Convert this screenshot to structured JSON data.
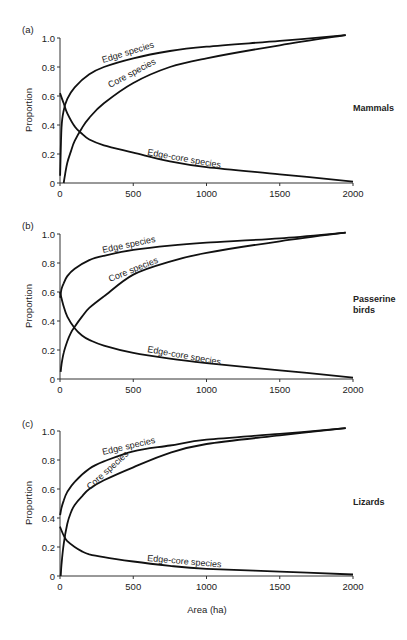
{
  "figure": {
    "xlabel": "Area (ha)",
    "ylabel": "Proportion"
  },
  "chart_data": [
    {
      "type": "line",
      "panel": "(a)",
      "title": "Mammals",
      "xlabel": "",
      "ylabel": "Proportion",
      "xlim": [
        0,
        2000
      ],
      "ylim": [
        0,
        1.0
      ],
      "xticks": [
        0,
        500,
        1000,
        1500,
        2000
      ],
      "yticks": [
        0,
        0.2,
        0.4,
        0.6,
        0.8,
        1.0
      ],
      "ytick_labels": [
        "0",
        "0.2",
        "0.4",
        "0.6",
        "0.8",
        "1.0"
      ],
      "grid": false,
      "series": [
        {
          "name": "Edge species",
          "x": [
            1,
            10,
            25,
            50,
            100,
            200,
            300,
            500,
            750,
            1000,
            1500,
            1950
          ],
          "values": [
            0.05,
            0.38,
            0.5,
            0.58,
            0.66,
            0.75,
            0.8,
            0.86,
            0.91,
            0.94,
            0.98,
            1.02
          ]
        },
        {
          "name": "Core species",
          "x": [
            25,
            35,
            50,
            75,
            100,
            150,
            200,
            300,
            500,
            750,
            1000,
            1500,
            1950
          ],
          "values": [
            0.0,
            0.06,
            0.14,
            0.22,
            0.29,
            0.38,
            0.45,
            0.55,
            0.69,
            0.8,
            0.86,
            0.95,
            1.02
          ]
        },
        {
          "name": "Edge-core species",
          "x": [
            0,
            25,
            50,
            100,
            150,
            200,
            300,
            500,
            750,
            1000,
            1500,
            2000
          ],
          "values": [
            0.62,
            0.55,
            0.48,
            0.39,
            0.34,
            0.3,
            0.26,
            0.21,
            0.15,
            0.11,
            0.06,
            0.01
          ]
        }
      ]
    },
    {
      "type": "line",
      "panel": "(b)",
      "title": "Passerine birds",
      "xlabel": "",
      "ylabel": "Proportion",
      "xlim": [
        0,
        2000
      ],
      "ylim": [
        0,
        1.0
      ],
      "xticks": [
        0,
        500,
        1000,
        1500,
        2000
      ],
      "yticks": [
        0,
        0.2,
        0.4,
        0.6,
        0.8,
        1.0
      ],
      "ytick_labels": [
        "0",
        "0.2",
        "0.4",
        "0.6",
        "0.8",
        "1.0"
      ],
      "grid": false,
      "series": [
        {
          "name": "Edge species",
          "x": [
            1,
            10,
            25,
            50,
            100,
            200,
            300,
            500,
            750,
            1000,
            1500,
            1950
          ],
          "values": [
            0.56,
            0.62,
            0.66,
            0.71,
            0.76,
            0.82,
            0.85,
            0.89,
            0.92,
            0.94,
            0.97,
            1.01
          ]
        },
        {
          "name": "Core species",
          "x": [
            5,
            10,
            25,
            50,
            75,
            100,
            150,
            200,
            300,
            500,
            750,
            1000,
            1500,
            1950
          ],
          "values": [
            0.05,
            0.1,
            0.18,
            0.26,
            0.32,
            0.36,
            0.43,
            0.49,
            0.57,
            0.72,
            0.81,
            0.87,
            0.95,
            1.01
          ]
        },
        {
          "name": "Edge-core species",
          "x": [
            0,
            25,
            50,
            100,
            150,
            200,
            300,
            500,
            750,
            1000,
            1500,
            2000
          ],
          "values": [
            0.6,
            0.5,
            0.43,
            0.35,
            0.3,
            0.27,
            0.23,
            0.18,
            0.14,
            0.11,
            0.06,
            0.01
          ]
        }
      ]
    },
    {
      "type": "line",
      "panel": "(c)",
      "title": "Lizards",
      "xlabel": "Area (ha)",
      "ylabel": "Proportion",
      "xlim": [
        0,
        2000
      ],
      "ylim": [
        0,
        1.0
      ],
      "xticks": [
        0,
        500,
        1000,
        1500,
        2000
      ],
      "yticks": [
        0,
        0.2,
        0.4,
        0.6,
        0.8,
        1.0
      ],
      "ytick_labels": [
        "0",
        "0.2",
        "0.4",
        "0.6",
        "0.8",
        "1.0"
      ],
      "grid": false,
      "series": [
        {
          "name": "Edge species",
          "x": [
            1,
            10,
            25,
            50,
            100,
            200,
            300,
            500,
            750,
            1000,
            1500,
            1950
          ],
          "values": [
            0.42,
            0.47,
            0.52,
            0.58,
            0.65,
            0.74,
            0.79,
            0.86,
            0.9,
            0.94,
            0.98,
            1.02
          ]
        },
        {
          "name": "Core species",
          "x": [
            5,
            10,
            25,
            50,
            75,
            100,
            150,
            200,
            300,
            500,
            750,
            1000,
            1500,
            1950
          ],
          "values": [
            0.0,
            0.08,
            0.22,
            0.36,
            0.44,
            0.49,
            0.55,
            0.6,
            0.66,
            0.75,
            0.85,
            0.91,
            0.97,
            1.02
          ]
        },
        {
          "name": "Edge-core species",
          "x": [
            0,
            25,
            50,
            100,
            150,
            200,
            300,
            500,
            750,
            1000,
            1500,
            2000
          ],
          "values": [
            0.34,
            0.28,
            0.24,
            0.2,
            0.17,
            0.15,
            0.13,
            0.1,
            0.07,
            0.05,
            0.03,
            0.01
          ]
        }
      ]
    }
  ],
  "panels": [
    {
      "label": "(a)",
      "taxon": [
        "Mammals"
      ],
      "curve_labels": {
        "edge": "Edge species",
        "core": "Core species",
        "edge_core": "Edge-core species"
      }
    },
    {
      "label": "(b)",
      "taxon": [
        "Passerine",
        "birds"
      ],
      "curve_labels": {
        "edge": "Edge species",
        "core": "Core species",
        "edge_core": "Edge-core species"
      }
    },
    {
      "label": "(c)",
      "taxon": [
        "Lizards"
      ],
      "curve_labels": {
        "edge": "Edge species",
        "core": "Core species",
        "edge_core": "Edge-core species"
      }
    }
  ]
}
